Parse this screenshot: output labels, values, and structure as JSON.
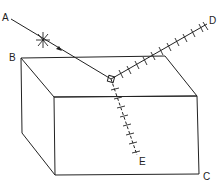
{
  "figure": {
    "type": "optics-diagram",
    "labels": {
      "A": "A",
      "B": "B",
      "C": "C",
      "D": "D",
      "E": "E"
    },
    "colors": {
      "line": "#222222",
      "background": "#ffffff"
    }
  }
}
